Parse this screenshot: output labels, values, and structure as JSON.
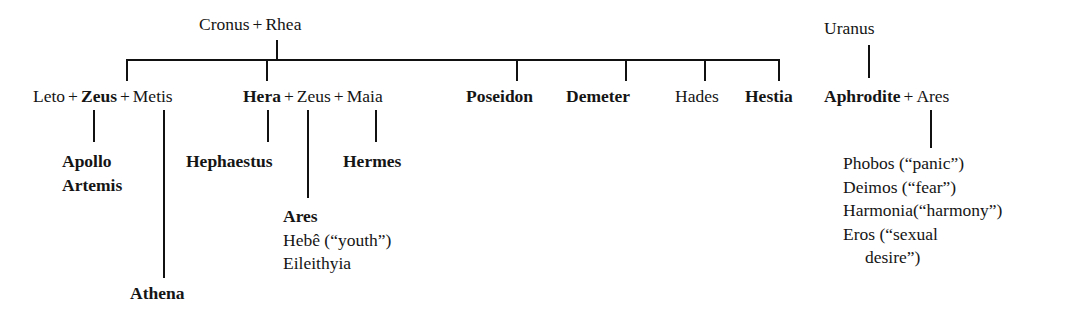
{
  "diagram": {
    "line_color": "#111111",
    "text_color": "#151515",
    "background": "#ffffff"
  },
  "generations": {
    "root": {
      "parent_a": "Cronus",
      "joiner": "+",
      "parent_b": "Rhea"
    },
    "uranus": {
      "name": "Uranus"
    }
  },
  "main_row": {
    "leto": "Leto",
    "plus1": "+",
    "zeus1": "Zeus",
    "plus2": "+",
    "metis": "Metis",
    "hera": "Hera",
    "plus3": "+",
    "zeus2": "Zeus",
    "plus4": "+",
    "maia": "Maia",
    "poseidon": "Poseidon",
    "demeter": "Demeter",
    "hades": "Hades",
    "hestia": "Hestia",
    "aphrodite": "Aphrodite",
    "plus5": "+",
    "ares_consort": "Ares"
  },
  "offspring": {
    "leto_zeus": [
      "Apollo",
      "Artemis"
    ],
    "zeus_metis": [
      "Athena"
    ],
    "hera_alone": [
      "Hephaestus"
    ],
    "hera_zeus": [
      "Ares",
      "Hebê (“youth”)",
      "Eileithyia"
    ],
    "zeus_maia": [
      "Hermes"
    ],
    "aphrodite_ares": [
      "Phobos (“panic”)",
      "Deimos (“fear”)",
      "Harmonia(“harmony”)",
      "Eros (“sexual",
      "desire”)"
    ]
  },
  "offspring_text": {
    "apollo": "Apollo",
    "artemis": "Artemis",
    "athena": "Athena",
    "hephaestus": "Hephaestus",
    "hermes": "Hermes",
    "ares": "Ares",
    "hebe": "Hebê (“youth”)",
    "eileithyia": "Eileithyia",
    "phobos": "Phobos (“panic”)",
    "deimos": "Deimos (“fear”)",
    "harmonia": "Harmonia(“harmony”)",
    "eros_line1": "Eros (“sexual",
    "eros_line2": "desire”)"
  }
}
